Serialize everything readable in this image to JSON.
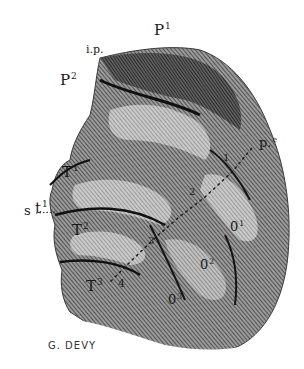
{
  "illustration": {
    "subject": "engraved brain lobe with labeled gyri",
    "colors": {
      "background": "#ffffff",
      "ink": "#1a1a1a",
      "shade_dark": "#2a2a2a",
      "shade_mid": "#6b6b6b",
      "shade_light": "#b8b8b8"
    },
    "labels": {
      "p1": {
        "base": "P",
        "sup": "1"
      },
      "ip": {
        "base": "i.p."
      },
      "p2": {
        "base": "P",
        "sup": "2"
      },
      "s": {
        "base": "s"
      },
      "t1_upper": {
        "base": "T",
        "sup": "1"
      },
      "t1_lower": {
        "base": "t",
        "sup": "1"
      },
      "t2": {
        "base": "T",
        "sup": "2"
      },
      "t3": {
        "base": "T",
        "sup": "3"
      },
      "pe": {
        "base": "p.",
        "sup": "e"
      },
      "o1": {
        "base": "0",
        "sup": "1"
      },
      "o2": {
        "base": "0",
        "sup": "2"
      },
      "o3": {
        "base": "0",
        "sup": "3"
      },
      "n1": "1",
      "n2": "2",
      "n3": "3",
      "n4": "4"
    },
    "signature": "G. DEVY"
  }
}
